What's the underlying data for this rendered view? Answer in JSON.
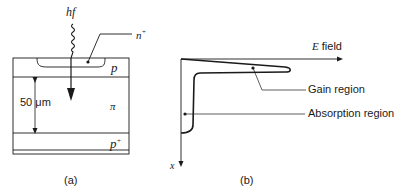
{
  "panel_a": {
    "caption": "(a)",
    "photon_label": "hf",
    "layers": {
      "n_plus": "n",
      "n_plus_sup": "+",
      "p": "p",
      "pi": "π",
      "p_plus": "p",
      "p_plus_sup": "+"
    },
    "dimension_label": "50 μm"
  },
  "panel_b": {
    "caption": "(b)",
    "x_axis_label": "E",
    "x_axis_label_suffix": " field",
    "y_axis_label": "x",
    "annotations": {
      "gain": "Gain region",
      "absorption": "Absorption region"
    }
  },
  "colors": {
    "ink": "#1a1a1a",
    "background": "#ffffff"
  }
}
